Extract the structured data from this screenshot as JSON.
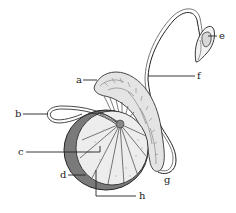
{
  "diagram": {
    "labels": [
      {
        "id": "a",
        "text": "a",
        "x": 76,
        "y": 75
      },
      {
        "id": "b",
        "text": "b",
        "x": 15,
        "y": 109
      },
      {
        "id": "c",
        "text": "c",
        "x": 18,
        "y": 147
      },
      {
        "id": "d",
        "text": "d",
        "x": 60,
        "y": 170
      },
      {
        "id": "e",
        "text": "e",
        "x": 219,
        "y": 31
      },
      {
        "id": "f",
        "text": "f",
        "x": 197,
        "y": 71
      },
      {
        "id": "g",
        "text": "g",
        "x": 164,
        "y": 175
      },
      {
        "id": "h",
        "text": "h",
        "x": 139,
        "y": 191
      }
    ],
    "colors": {
      "line": "#222222",
      "fill_light": "#e6e6e6",
      "fill_mid": "#bdbdbd",
      "fill_dark": "#6f6f6f",
      "background": "#ffffff"
    }
  }
}
